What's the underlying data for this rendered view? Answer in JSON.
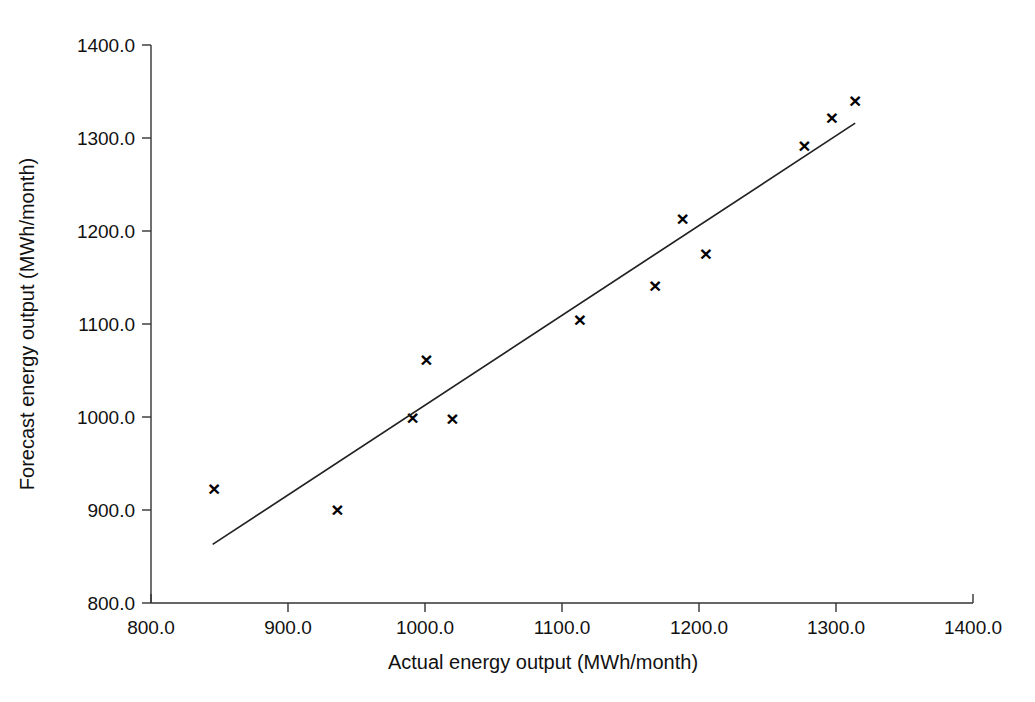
{
  "chart_data": {
    "type": "scatter",
    "title": "",
    "xlabel": "Actual energy output (MWh/month)",
    "ylabel": "Forecast energy output (MWh/month)",
    "xlim": [
      800,
      1400
    ],
    "ylim": [
      800,
      1400
    ],
    "xticks": [
      800,
      900,
      1000,
      1100,
      1200,
      1300,
      1400
    ],
    "yticks": [
      800,
      900,
      1000,
      1100,
      1200,
      1300,
      1400
    ],
    "xticklabels": [
      "800.0",
      "900.0",
      "1000.0",
      "1100.0",
      "1200.0",
      "1300.0",
      "1400.0"
    ],
    "yticklabels": [
      "800.0",
      "900.0",
      "1000.0",
      "1100.0",
      "1200.0",
      "1300.0",
      "1400.0"
    ],
    "grid": false,
    "legend": false,
    "marker": "x",
    "marker_color": "#000000",
    "series": [
      {
        "name": "Forecast vs actual",
        "marker": "x",
        "points": [
          {
            "x": 846,
            "y": 923
          },
          {
            "x": 936,
            "y": 901
          },
          {
            "x": 991,
            "y": 1000
          },
          {
            "x": 1001,
            "y": 1062
          },
          {
            "x": 1020,
            "y": 998
          },
          {
            "x": 1113,
            "y": 1105
          },
          {
            "x": 1168,
            "y": 1141
          },
          {
            "x": 1188,
            "y": 1213
          },
          {
            "x": 1205,
            "y": 1176
          },
          {
            "x": 1277,
            "y": 1292
          },
          {
            "x": 1297,
            "y": 1322
          },
          {
            "x": 1314,
            "y": 1340
          }
        ]
      }
    ],
    "trendline": {
      "type": "linear-fit",
      "color": "#222222",
      "x_start": 845,
      "y_start": 863,
      "x_end": 1314,
      "y_end": 1316
    }
  }
}
